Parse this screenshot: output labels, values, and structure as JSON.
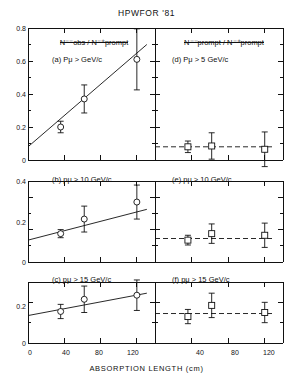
{
  "title": "HPWFOR '81",
  "xlabel": "ABSORPTION LENGTH (cm)",
  "left_column": {
    "ratio_numerator": "N",
    "ratio_num_sup": "−−",
    "ratio_num_tail": "obs",
    "ratio_denominator": "N",
    "ratio_den_sup": "−+",
    "ratio_den_tail": "prompt",
    "ratio_label": "N⁻⁻obs / N⁻⁺prompt"
  },
  "right_column": {
    "ratio_label": "N⁻⁻prompt / N⁻⁺prompt"
  },
  "panels": {
    "a": {
      "tag": "(a)",
      "cut": "Pμ > GeV/c",
      "label": "(a) Pμ > GeV/c"
    },
    "b": {
      "tag": "(b)",
      "cut": "pμ > 10 GeV/c",
      "label": "(b) pμ > 10 GeV/c"
    },
    "c": {
      "tag": "(c)",
      "cut": "pμ > 15 GeV/c",
      "label": "(c) pμ > 15 GeV/c"
    },
    "d": {
      "tag": "(d)",
      "cut": "Pμ > 5 GeV/c",
      "label": "(d) Pμ > 5 GeV/c"
    },
    "e": {
      "tag": "(e)",
      "cut": "pμ > 10 GeV/c",
      "label": "(e) pμ > 10 GeV/c"
    },
    "f": {
      "tag": "(f)",
      "cut": "pμ > 15 GeV/c",
      "label": "(f) pμ > 15 GeV/c"
    }
  },
  "axis_ticks": {
    "y_a": [
      "0.8",
      "0.6",
      "0.4",
      "0.2",
      "0"
    ],
    "y_b": [
      "0.4",
      "0.2",
      "0"
    ],
    "y_c": [
      "0.2",
      "0"
    ],
    "x_left": [
      "0",
      "40",
      "80",
      "120"
    ],
    "x_right": [
      "40",
      "80",
      "120"
    ]
  },
  "chart_data": {
    "type": "scatter",
    "title": "HPWFOR '81",
    "xlabel": "ABSORPTION LENGTH (cm)",
    "xlim": [
      0,
      140
    ],
    "grid": false,
    "legend": false,
    "panels": [
      {
        "id": "a",
        "label": "(a) Pμ > GeV/c",
        "ylabel": "N⁻⁻obs / N⁻⁺prompt",
        "ylim": [
          0,
          0.8
        ],
        "yticks": [
          0,
          0.2,
          0.4,
          0.6,
          0.8
        ],
        "marker": "open-circle",
        "x": [
          36,
          62,
          120
        ],
        "y": [
          0.2,
          0.37,
          0.61
        ],
        "yerr": [
          0.035,
          0.085,
          0.185
        ],
        "fit": {
          "type": "line",
          "style": "solid",
          "x": [
            0,
            131
          ],
          "y": [
            0.08,
            0.7
          ]
        }
      },
      {
        "id": "b",
        "label": "(b) pμ > 10 GeV/c",
        "ylabel": "N⁻⁻obs / N⁻⁺prompt",
        "ylim": [
          0,
          0.5
        ],
        "yticks": [
          0,
          0.2,
          0.4
        ],
        "marker": "open-circle",
        "x": [
          36,
          62,
          120
        ],
        "y": [
          0.175,
          0.265,
          0.37
        ],
        "yerr": [
          0.025,
          0.08,
          0.105
        ],
        "fit": {
          "type": "line",
          "style": "solid",
          "x": [
            0,
            131
          ],
          "y": [
            0.135,
            0.325
          ]
        }
      },
      {
        "id": "c",
        "label": "(c) pμ > 15 GeV/c",
        "ylabel": "N⁻⁻obs / N⁻⁺prompt",
        "ylim": [
          0,
          0.3
        ],
        "yticks": [
          0,
          0.2
        ],
        "marker": "open-circle",
        "x": [
          36,
          62,
          120
        ],
        "y": [
          0.155,
          0.215,
          0.235
        ],
        "yerr": [
          0.035,
          0.065,
          0.075
        ],
        "fit": {
          "type": "line",
          "style": "solid",
          "x": [
            0,
            131
          ],
          "y": [
            0.135,
            0.245
          ]
        }
      },
      {
        "id": "d",
        "label": "(d) Pμ > 5 GeV/c",
        "ylabel": "N⁻⁻prompt / N⁻⁺prompt",
        "ylim": [
          0,
          0.8
        ],
        "yticks": [
          0,
          0.2,
          0.4,
          0.6,
          0.8
        ],
        "marker": "open-square",
        "x": [
          36,
          62,
          120
        ],
        "y": [
          0.08,
          0.085,
          0.065
        ],
        "yerr": [
          0.035,
          0.08,
          0.105
        ],
        "fit": {
          "type": "line",
          "style": "dashed",
          "x": [
            0,
            131
          ],
          "y": [
            0.08,
            0.08
          ]
        }
      },
      {
        "id": "e",
        "label": "(e) pμ > 10 GeV/c",
        "ylabel": "N⁻⁻prompt / N⁻⁺prompt",
        "ylim": [
          0,
          0.5
        ],
        "yticks": [
          0,
          0.2,
          0.4
        ],
        "marker": "open-square",
        "x": [
          36,
          62,
          120
        ],
        "y": [
          0.135,
          0.175,
          0.165
        ],
        "yerr": [
          0.03,
          0.06,
          0.075
        ],
        "fit": {
          "type": "line",
          "style": "dashed",
          "x": [
            0,
            131
          ],
          "y": [
            0.145,
            0.145
          ]
        }
      },
      {
        "id": "f",
        "label": "(f) pμ > 15 GeV/c",
        "ylabel": "N⁻⁻prompt / N⁻⁺prompt",
        "ylim": [
          0,
          0.3
        ],
        "yticks": [
          0,
          0.2
        ],
        "marker": "open-square",
        "x": [
          36,
          62,
          120
        ],
        "y": [
          0.13,
          0.185,
          0.15
        ],
        "yerr": [
          0.035,
          0.06,
          0.05
        ],
        "fit": {
          "type": "line",
          "style": "dashed",
          "x": [
            0,
            131
          ],
          "y": [
            0.145,
            0.145
          ]
        }
      }
    ]
  }
}
